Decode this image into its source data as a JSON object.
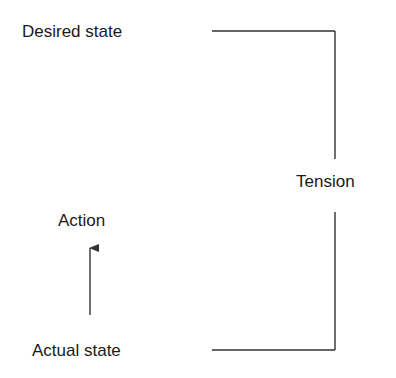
{
  "diagram": {
    "labels": {
      "desired_state": "Desired state",
      "action": "Action",
      "actual_state": "Actual state",
      "tension": "Tension"
    },
    "colors": {
      "line": "#333333",
      "text": "#1a1a1a",
      "background": "#ffffff"
    }
  }
}
